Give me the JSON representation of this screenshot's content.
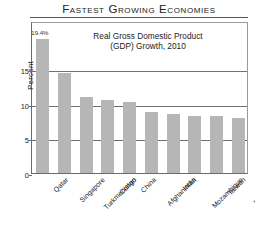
{
  "chart_data": {
    "type": "bar",
    "title": "Fastest Growing Economies",
    "subtitle_line1": "Real Gross Domestic Product",
    "subtitle_line2": "(GDP) Growth, 2010",
    "xlabel": "",
    "ylabel": "Percent",
    "ylim": [
      0,
      22
    ],
    "yticks": [
      0,
      5,
      10,
      15
    ],
    "grid": true,
    "legend": "none",
    "bar_color": "#b6b6b6",
    "categories": [
      "Qatar",
      "Singapore",
      "Turkmenistan",
      "Congo",
      "China",
      "Afghanistan",
      "India",
      "Mozambique",
      "Taiwan",
      "Uzbekistan"
    ],
    "values": [
      19.4,
      14.5,
      11.0,
      10.5,
      10.3,
      8.9,
      8.6,
      8.3,
      8.2,
      8.0
    ],
    "data_labels": [
      "19.4%",
      "",
      "",
      "",
      "",
      "",
      "",
      "",
      "",
      ""
    ]
  }
}
